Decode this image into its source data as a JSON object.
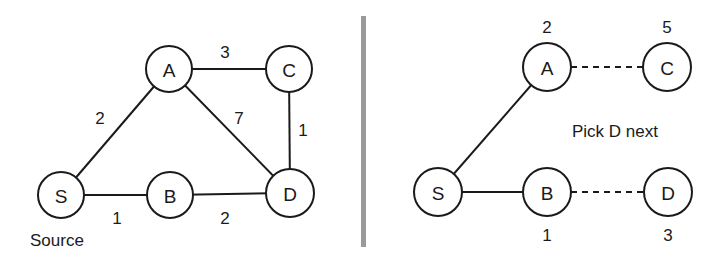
{
  "left_graph": {
    "caption": "Source",
    "nodes": [
      {
        "id": "S",
        "label": "S",
        "cx": 61,
        "cy": 195
      },
      {
        "id": "A",
        "label": "A",
        "cx": 169,
        "cy": 69
      },
      {
        "id": "C",
        "label": "C",
        "cx": 289,
        "cy": 69
      },
      {
        "id": "B",
        "label": "B",
        "cx": 170,
        "cy": 195
      },
      {
        "id": "D",
        "label": "D",
        "cx": 290,
        "cy": 193
      }
    ],
    "edges": [
      {
        "from": "S",
        "to": "A",
        "weight": "2",
        "lx": 100,
        "ly": 118
      },
      {
        "from": "A",
        "to": "C",
        "weight": "3",
        "lx": 225,
        "ly": 52
      },
      {
        "from": "A",
        "to": "D",
        "weight": "7",
        "lx": 239,
        "ly": 118
      },
      {
        "from": "C",
        "to": "D",
        "weight": "1",
        "lx": 303,
        "ly": 130
      },
      {
        "from": "S",
        "to": "B",
        "weight": "1",
        "lx": 117,
        "ly": 218
      },
      {
        "from": "B",
        "to": "D",
        "weight": "2",
        "lx": 225,
        "ly": 218
      }
    ]
  },
  "right_graph": {
    "annotation": "Pick D next",
    "nodes": [
      {
        "id": "S",
        "label": "S",
        "cx": 438,
        "cy": 192,
        "dist": ""
      },
      {
        "id": "A",
        "label": "A",
        "cx": 547,
        "cy": 67,
        "dist": "2"
      },
      {
        "id": "C",
        "label": "C",
        "cx": 667,
        "cy": 67,
        "dist": "5"
      },
      {
        "id": "B",
        "label": "B",
        "cx": 547,
        "cy": 192,
        "dist": "1"
      },
      {
        "id": "D",
        "label": "D",
        "cx": 668,
        "cy": 192,
        "dist": "3"
      }
    ],
    "tree_edges": [
      {
        "from": "S",
        "to": "A"
      },
      {
        "from": "S",
        "to": "B"
      }
    ],
    "tentative_edges": [
      {
        "from": "A",
        "to": "C"
      },
      {
        "from": "B",
        "to": "D"
      }
    ]
  },
  "colors": {
    "stroke": "#1a1a1a",
    "divider": "#9a9a9a",
    "background": "#ffffff"
  }
}
